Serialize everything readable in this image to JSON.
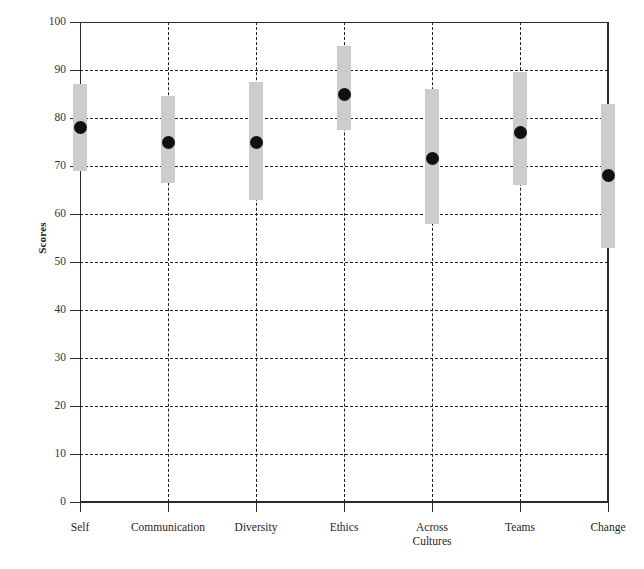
{
  "chart_data": {
    "type": "scatter",
    "title": "",
    "xlabel": "",
    "ylabel": "Scores",
    "ylim": [
      0,
      100
    ],
    "yticks": [
      0,
      10,
      20,
      30,
      40,
      50,
      60,
      70,
      80,
      90,
      100
    ],
    "grid": "horizontal-dashed-and-vertical-dashed",
    "legend": "none",
    "categories": [
      "Self",
      "Communication",
      "Diversity",
      "Ethics",
      "Across\nCultures",
      "Teams",
      "Change"
    ],
    "series": [
      {
        "name": "Mean score",
        "marker": "filled-circle",
        "color": "#111111",
        "values": [
          78,
          75,
          75,
          85,
          71.5,
          77,
          68
        ]
      },
      {
        "name": "Range band",
        "marker": "vertical-bar",
        "color": "#cccccc",
        "lower": [
          69,
          66.5,
          63,
          77.5,
          58,
          66,
          53
        ],
        "upper": [
          87,
          84.5,
          87.5,
          95,
          86,
          89.5,
          83
        ]
      }
    ]
  },
  "axis": {
    "y_title": "Scores",
    "y_tick_labels": [
      "100",
      "90",
      "80",
      "70",
      "60",
      "50",
      "40",
      "30",
      "20",
      "10",
      "0"
    ],
    "x_tick_labels": [
      "Self",
      "Communication",
      "Diversity",
      "Ethics",
      "Across\nCultures",
      "Teams",
      "Change"
    ]
  },
  "style": {
    "band_color": "#cccccc",
    "dot_color": "#111111",
    "axis_color": "#2b2b2b",
    "grid_color": "#1f1f1f",
    "background": "#ffffff"
  }
}
